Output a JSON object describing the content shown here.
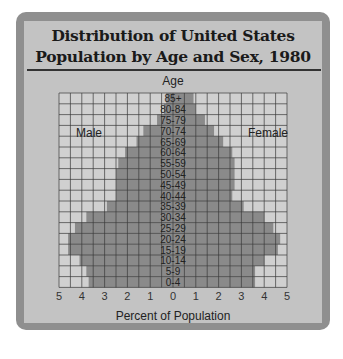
{
  "chart_data": {
    "type": "bar",
    "subtype": "population-pyramid",
    "title": "Distribution of United States Population by Age and Sex, 1980",
    "title_lines": [
      "Distribution of United States",
      "Population by Age and Sex, 1980"
    ],
    "ylabel": "Age",
    "xlabel": "Percent of Population",
    "xlim": [
      -5,
      5
    ],
    "x_ticks": [
      5,
      4,
      3,
      2,
      1,
      0,
      1,
      2,
      3,
      4,
      5
    ],
    "grid": true,
    "grid_step_percent": 0.5,
    "categories": [
      "85+",
      "80-84",
      "75-79",
      "70-74",
      "65-69",
      "60-64",
      "55-59",
      "50-54",
      "45-49",
      "40-44",
      "35-39",
      "30-34",
      "25-29",
      "20-24",
      "15-19",
      "10-14",
      "5-9",
      "0-4"
    ],
    "series": [
      {
        "name": "Male",
        "side": "left",
        "values": [
          0.3,
          0.4,
          0.7,
          1.3,
          1.6,
          2.1,
          2.4,
          2.5,
          2.5,
          2.5,
          2.9,
          3.8,
          4.3,
          4.6,
          4.6,
          4.1,
          3.8,
          3.7
        ]
      },
      {
        "name": "Female",
        "side": "right",
        "values": [
          0.9,
          1.0,
          1.4,
          1.8,
          2.2,
          2.6,
          2.7,
          2.7,
          2.7,
          2.6,
          3.1,
          4.0,
          4.4,
          4.7,
          4.6,
          4.0,
          3.6,
          3.6
        ]
      }
    ],
    "legend": [
      "Male",
      "Female"
    ]
  },
  "colors": {
    "frame": "#8f8f8f",
    "panel": "#c3c3c3",
    "bar": "#8a8a8a",
    "grid_bg": "#d0d0d0",
    "grid_line": "#3a3a3a"
  }
}
